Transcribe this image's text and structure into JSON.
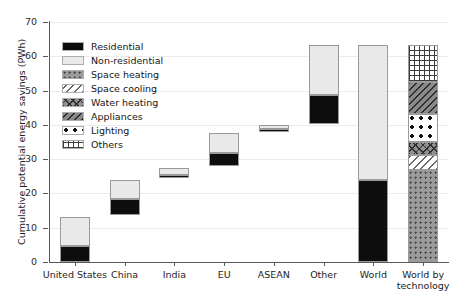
{
  "chart_data": {
    "type": "bar",
    "subtype": "waterfall-stacked",
    "title": "",
    "xlabel": "",
    "ylabel": "Cumulative potential energy savings (PWh)",
    "ylim": [
      0,
      70
    ],
    "yticks": [
      0,
      10,
      20,
      30,
      40,
      50,
      60,
      70
    ],
    "grid": true,
    "legend_position": "upper-left-inside",
    "categories": [
      "United States",
      "China",
      "India",
      "EU",
      "ASEAN",
      "Other",
      "World",
      "World by\ntechnology"
    ],
    "legend": [
      "Residential",
      "Non-residential",
      "Space heating",
      "Space cooling",
      "Water heating",
      "Appliances",
      "Lighting",
      "Others"
    ],
    "series": [
      {
        "name": "Residential",
        "pattern": "solid-black",
        "color": "#0d0d0d",
        "segments": [
          {
            "category": "United States",
            "base": 0.0,
            "top": 4.6
          },
          {
            "category": "China",
            "base": 13.6,
            "top": 18.4
          },
          {
            "category": "India",
            "base": 24.4,
            "top": 25.4
          },
          {
            "category": "EU",
            "base": 28.0,
            "top": 31.8
          },
          {
            "category": "ASEAN",
            "base": 38.0,
            "top": 38.7
          },
          {
            "category": "Other",
            "base": 40.3,
            "top": 48.8
          },
          {
            "category": "World",
            "base": 0.0,
            "top": 24.0
          }
        ]
      },
      {
        "name": "Non-residential",
        "pattern": "solid-light-grey",
        "color": "#e9e9e9",
        "segments": [
          {
            "category": "United States",
            "base": 4.6,
            "top": 13.2
          },
          {
            "category": "China",
            "base": 18.4,
            "top": 23.8
          },
          {
            "category": "India",
            "base": 25.4,
            "top": 27.4
          },
          {
            "category": "EU",
            "base": 31.8,
            "top": 37.5
          },
          {
            "category": "ASEAN",
            "base": 38.7,
            "top": 39.9
          },
          {
            "category": "Other",
            "base": 48.8,
            "top": 63.2
          },
          {
            "category": "World",
            "base": 24.0,
            "top": 63.4
          }
        ]
      },
      {
        "name": "Space heating",
        "pattern": "dotted-grey",
        "segments": [
          {
            "category": "World by technology",
            "base": 0.0,
            "top": 26.8
          }
        ]
      },
      {
        "name": "Space cooling",
        "pattern": "diagonal-lines",
        "segments": [
          {
            "category": "World by technology",
            "base": 26.8,
            "top": 31.2
          }
        ]
      },
      {
        "name": "Water heating",
        "pattern": "crosshatch-grey",
        "segments": [
          {
            "category": "World by technology",
            "base": 31.2,
            "top": 35.0
          }
        ]
      },
      {
        "name": "Lighting",
        "pattern": "large-dots",
        "segments": [
          {
            "category": "World by technology",
            "base": 35.0,
            "top": 43.2
          }
        ]
      },
      {
        "name": "Appliances",
        "pattern": "dense-diagonal-grey",
        "segments": [
          {
            "category": "World by technology",
            "base": 43.2,
            "top": 52.4
          }
        ]
      },
      {
        "name": "Others",
        "pattern": "grid-hatch",
        "segments": [
          {
            "category": "World by technology",
            "base": 52.4,
            "top": 63.4
          }
        ]
      }
    ],
    "totals": {
      "United States": 13.2,
      "China": 10.2,
      "India": 3.0,
      "EU": 9.5,
      "ASEAN": 1.9,
      "Other": 22.9,
      "World": 63.4,
      "World by technology": 63.4
    }
  }
}
